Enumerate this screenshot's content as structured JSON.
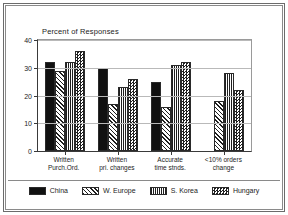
{
  "chart_data": {
    "type": "bar",
    "title": "Percent of Responses",
    "xlabel": "",
    "ylabel": "",
    "ylim": [
      0,
      40
    ],
    "yticks": [
      0,
      10,
      20,
      30,
      40
    ],
    "grid": true,
    "legend_position": "bottom",
    "categories": [
      "Written Purch.Ord.",
      "Written pri. changes",
      "Accurate time stnds.",
      "<10% orders change"
    ],
    "category_lines": [
      {
        "line1": "Written",
        "line2": "Purch.Ord."
      },
      {
        "line1": "Written",
        "line2": "pri. changes"
      },
      {
        "line1": "Accurate",
        "line2": "time stnds."
      },
      {
        "line1": "<10% orders",
        "line2": "change"
      }
    ],
    "series": [
      {
        "name": "China",
        "pattern": "solid",
        "values": [
          32,
          30,
          25,
          0
        ]
      },
      {
        "name": "W. Europe",
        "pattern": "diagonal-hatch",
        "values": [
          29,
          17,
          16,
          18
        ]
      },
      {
        "name": "S. Korea",
        "pattern": "grid-lines",
        "values": [
          32,
          23,
          31,
          28
        ]
      },
      {
        "name": "Hungary",
        "pattern": "checkerboard",
        "values": [
          36,
          26,
          32,
          22
        ]
      }
    ]
  },
  "colors": {
    "axis": "#3a3a3a",
    "grid": "#b9b9b9",
    "bar_outline": "#2a2a2a",
    "fill_dark": "#111111",
    "frame": "#6b6b6b",
    "background": "#ffffff",
    "text": "#232323"
  }
}
